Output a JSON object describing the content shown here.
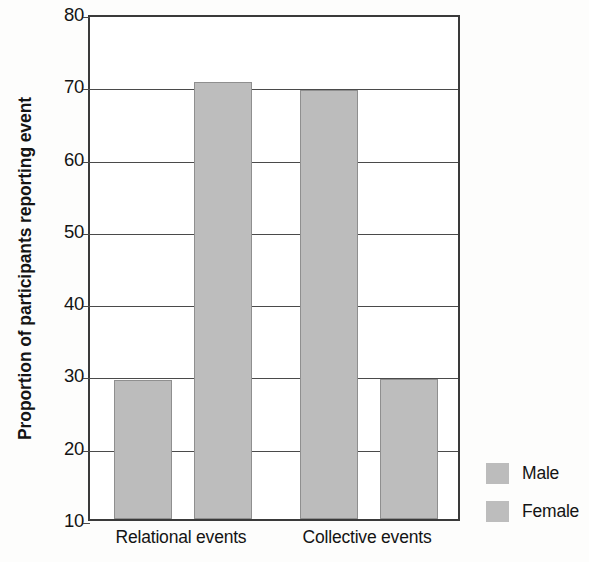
{
  "chart_data": {
    "type": "bar",
    "title": "",
    "xlabel": "",
    "ylabel": "Proportion of participants reporting event",
    "categories": [
      "Relational events",
      "Collective events"
    ],
    "series": [
      {
        "name": "Male",
        "values": [
          29.3,
          69.3
        ],
        "color": "#bcbcbc"
      },
      {
        "name": "Female",
        "values": [
          70.5,
          29.4
        ],
        "color": "#bdbdbd"
      }
    ],
    "ylim": [
      10,
      80
    ],
    "yticks": [
      10,
      20,
      30,
      40,
      50,
      60,
      70,
      80
    ],
    "ytick_labels": [
      "10",
      "20",
      "30",
      "40",
      "50",
      "60",
      "70",
      "80"
    ],
    "grid": true,
    "grid_axis": "y",
    "legend_position": "right",
    "legend": [
      {
        "label": "Male",
        "color": "#bcbcbc"
      },
      {
        "label": "Female",
        "color": "#bdbdbd"
      }
    ],
    "bar_edge_color": "#8f8f8f",
    "axis_color": "#3a3a3a",
    "background": "#ffffff"
  }
}
